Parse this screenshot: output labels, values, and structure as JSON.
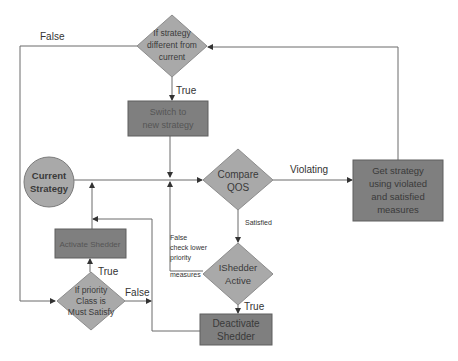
{
  "diagram": {
    "colors": {
      "diamond_fill": "#a9a9a9",
      "diamond_stroke": "#8c8c8c",
      "box_fill": "#7f7f7f",
      "box_stroke": "#5f5f5f",
      "circle_fill": "#a9a9a9",
      "line": "#555555",
      "background": "#ffffff"
    },
    "nodes": {
      "strategy_check": {
        "shape": "diamond",
        "lines": [
          "If strategy",
          "different from",
          "current"
        ]
      },
      "switch_strategy": {
        "shape": "box",
        "lines": [
          "Switch to",
          "new strategy"
        ]
      },
      "current_strategy": {
        "shape": "circle",
        "lines": [
          "Current",
          "Strategy"
        ]
      },
      "compare_qos": {
        "shape": "diamond",
        "lines": [
          "Compare",
          "QOS"
        ]
      },
      "get_strategy": {
        "shape": "box",
        "lines": [
          "Get strategy",
          "using violated",
          "and satisfied",
          "measures"
        ]
      },
      "shedder_active": {
        "shape": "diamond",
        "lines": [
          "IShedder",
          "Active"
        ]
      },
      "deactivate_shedder": {
        "shape": "box",
        "lines": [
          "Deactivate",
          "Shedder"
        ]
      },
      "activate_shedder": {
        "shape": "box",
        "lines": [
          "Activate Shedder"
        ]
      },
      "priority_check": {
        "shape": "diamond",
        "lines": [
          "If  priority",
          "Class is",
          "Must Satisfy"
        ]
      }
    },
    "edge_labels": {
      "strategy_false": "False",
      "strategy_true": "True",
      "violating": "Violating",
      "satisfied": "Satisfied",
      "shedder_false": [
        "False",
        "check lower",
        "priority",
        "measures"
      ],
      "shedder_true": "True",
      "priority_true": "True",
      "priority_false": "False"
    }
  }
}
